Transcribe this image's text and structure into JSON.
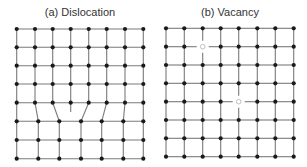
{
  "panels": [
    {
      "id": "dislocation",
      "title": "(a) Dislocation",
      "title_x": 80,
      "top_xs": [
        16.7,
        35,
        52.7,
        70.7,
        88.7,
        106.7,
        125,
        143.3
      ],
      "top_ys": [
        29,
        47.3,
        65.7,
        84,
        102.7
      ],
      "bottom_xs": [
        16.7,
        38.3,
        59.3,
        81,
        101.7,
        123.3,
        143.3
      ],
      "bottom_ys": [
        121.3,
        140,
        158.7
      ],
      "extra_half_plane": {
        "x": 70.7,
        "y1": 102.7,
        "y2": 112
      }
    },
    {
      "id": "vacancy",
      "title": "(b) Vacancy",
      "title_x": 230,
      "xs": [
        166,
        184.3,
        202.7,
        220.7,
        238.7,
        257.3,
        275.3,
        293.7
      ],
      "ys": [
        28.3,
        46.7,
        65,
        83.3,
        101.7,
        120,
        138.3,
        156.7
      ],
      "vacancies": [
        {
          "col": 2,
          "row": 1
        },
        {
          "col": 4,
          "row": 4
        }
      ]
    }
  ],
  "colors": {
    "line": "#7a7a7a",
    "atom": "#1a1a1a",
    "vacancy_stroke": "#b0b0b0",
    "title": "#333333"
  }
}
